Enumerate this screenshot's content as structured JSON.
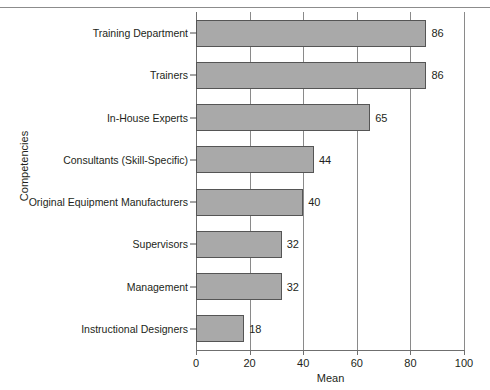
{
  "chart_data": {
    "type": "bar",
    "orientation": "horizontal",
    "title": "",
    "xlabel": "Mean",
    "ylabel": "Competencies",
    "xlim": [
      0,
      100
    ],
    "xticks": [
      0,
      20,
      40,
      60,
      80,
      100
    ],
    "grid": "vertical",
    "legend": "none",
    "bar_color": "#a9a9a9",
    "bar_edge_color": "#555555",
    "categories": [
      "Training Department",
      "Trainers",
      "In-House Experts",
      "Consultants (Skill-Specific)",
      "Original Equipment Manufacturers",
      "Supervisors",
      "Management",
      "Instructional Designers"
    ],
    "values": [
      86,
      86,
      65,
      44,
      40,
      32,
      32,
      18
    ],
    "value_labels": [
      "86",
      "86",
      "65",
      "44",
      "40",
      "32",
      "32",
      "18"
    ],
    "xtick_labels": [
      "0",
      "20",
      "40",
      "60",
      "80",
      "100"
    ]
  }
}
